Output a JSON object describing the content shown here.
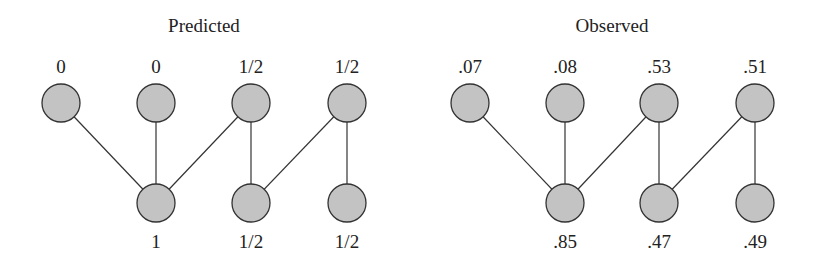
{
  "panels": [
    {
      "title": "Predicted",
      "top_nodes": [
        {
          "label": "0",
          "x": 61,
          "y": 103
        },
        {
          "label": "0",
          "x": 156,
          "y": 103
        },
        {
          "label": "1/2",
          "x": 251,
          "y": 103
        },
        {
          "label": "1/2",
          "x": 347,
          "y": 103
        }
      ],
      "bottom_nodes": [
        {
          "label": "1",
          "x": 156,
          "y": 203
        },
        {
          "label": "1/2",
          "x": 251,
          "y": 203
        },
        {
          "label": "1/2",
          "x": 347,
          "y": 203
        }
      ],
      "edges": [
        [
          0,
          0
        ],
        [
          1,
          0
        ],
        [
          2,
          0
        ],
        [
          2,
          1
        ],
        [
          3,
          1
        ],
        [
          3,
          2
        ]
      ]
    },
    {
      "title": "Observed",
      "top_nodes": [
        {
          "label": ".07",
          "x": 470,
          "y": 103
        },
        {
          "label": ".08",
          "x": 565,
          "y": 103
        },
        {
          "label": ".53",
          "x": 659,
          "y": 103
        },
        {
          "label": ".51",
          "x": 755,
          "y": 103
        }
      ],
      "bottom_nodes": [
        {
          "label": ".85",
          "x": 565,
          "y": 203
        },
        {
          "label": ".47",
          "x": 659,
          "y": 203
        },
        {
          "label": ".49",
          "x": 755,
          "y": 203
        }
      ],
      "edges": [
        [
          0,
          0
        ],
        [
          1,
          0
        ],
        [
          2,
          0
        ],
        [
          2,
          1
        ],
        [
          3,
          1
        ],
        [
          3,
          2
        ]
      ]
    }
  ],
  "style": {
    "node_fill": "#c3c3c3",
    "node_stroke": "#333333",
    "node_radius": 19
  }
}
